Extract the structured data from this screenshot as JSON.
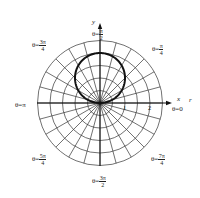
{
  "chart_data": {
    "type": "line",
    "subtype": "polar",
    "title": "",
    "curve": {
      "equation": "r = 2 sin θ",
      "description": "circle centered at (0,1) with radius 1, passing through the pole",
      "points_r_theta": [
        [
          0,
          0
        ],
        [
          0.518,
          0.2618
        ],
        [
          1,
          0.5236
        ],
        [
          1.414,
          0.7854
        ],
        [
          1.732,
          1.0472
        ],
        [
          1.932,
          1.309
        ],
        [
          2,
          1.5708
        ],
        [
          1.932,
          1.8326
        ],
        [
          1.732,
          2.0944
        ],
        [
          1.414,
          2.3562
        ],
        [
          1,
          2.618
        ],
        [
          0.518,
          2.8798
        ],
        [
          0,
          3.1416
        ]
      ],
      "color": "#111111",
      "stroke_width": 2
    },
    "grid": {
      "rings": [
        0.5,
        1,
        1.5,
        2,
        2.5
      ],
      "radial_step_degrees": 15,
      "color": "#333333"
    },
    "axes": {
      "x_label": "x",
      "y_label": "y",
      "r_ticks": [
        {
          "value": "1",
          "r": 1
        },
        {
          "value": "2",
          "r": 2
        }
      ]
    },
    "angle_labels": [
      {
        "key": "theta_0",
        "prefix": "θ=",
        "value": "0"
      },
      {
        "key": "theta_pi_4",
        "prefix": "θ=",
        "num": "π",
        "den": "4"
      },
      {
        "key": "theta_pi_2",
        "prefix": "θ=",
        "num": "π",
        "den": "2"
      },
      {
        "key": "theta_3pi_4",
        "prefix": "θ=",
        "num": "3π",
        "den": "4"
      },
      {
        "key": "theta_pi",
        "prefix": "θ=",
        "value": "π"
      },
      {
        "key": "theta_5pi_4",
        "prefix": "θ=",
        "num": "5π",
        "den": "4"
      },
      {
        "key": "theta_3pi_2",
        "prefix": "θ=",
        "num": "3π",
        "den": "2"
      },
      {
        "key": "theta_7pi_4",
        "prefix": "θ=",
        "num": "7π",
        "den": "4"
      }
    ],
    "extra_axis_label": "r"
  }
}
